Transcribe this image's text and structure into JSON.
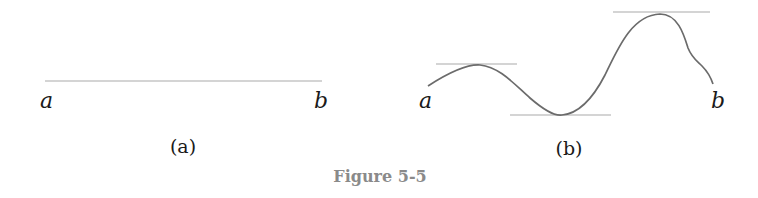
{
  "figure": {
    "caption": "Figure 5-5",
    "colors": {
      "tangent_line": "#c6c6c6",
      "curve": "#6b6b6b",
      "caption": "#8a8a8a",
      "label": "#1a1a1a"
    },
    "panels": [
      {
        "id": "a",
        "sublabel": "(a)",
        "left_endpoint_label": "a",
        "right_endpoint_label": "b",
        "description": "horizontal line segment from a to b"
      },
      {
        "id": "b",
        "sublabel": "(b)",
        "left_endpoint_label": "a",
        "right_endpoint_label": "b",
        "description": "curve from a to b with horizontal tangent lines at local maximum, local minimum, and global maximum",
        "tangent_points": [
          "local maximum",
          "local minimum",
          "global maximum"
        ]
      }
    ]
  }
}
